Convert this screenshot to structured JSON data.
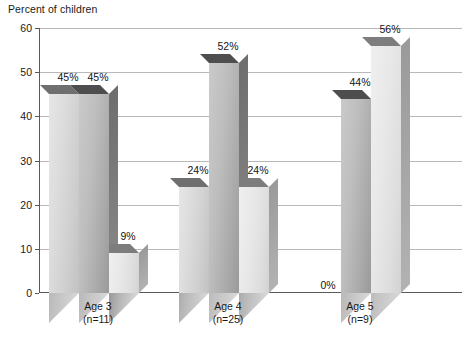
{
  "chart_data": {
    "type": "bar",
    "title": "",
    "subtitle": "",
    "ylabel": "Percent of children",
    "xlabel": "",
    "ylim": [
      0,
      60
    ],
    "yticks": [
      0,
      10,
      20,
      30,
      40,
      50,
      60
    ],
    "ytick_labels": [
      "0",
      "10",
      "20",
      "30",
      "40",
      "50",
      "60"
    ],
    "grid": true,
    "legend": "none",
    "categories": [
      "Age 3",
      "Age 4",
      "Age 5"
    ],
    "category_sublabels": [
      "(n=11)",
      "(n=25)",
      "(n=9)"
    ],
    "series": [
      {
        "name": "Series 1",
        "values": [
          45,
          24,
          0
        ],
        "data_labels": [
          "45%",
          "24%",
          "0%"
        ]
      },
      {
        "name": "Series 2",
        "values": [
          45,
          52,
          44
        ],
        "data_labels": [
          "45%",
          "52%",
          "44%"
        ]
      },
      {
        "name": "Series 3",
        "values": [
          9,
          24,
          56
        ],
        "data_labels": [
          "9%",
          "24%",
          "56%"
        ]
      }
    ],
    "colors": {
      "series1": "#dcdcdc",
      "series2": "#bdbdbd",
      "series3": "#e8e8e8",
      "gridline": "#b9b9b9",
      "axis": "#5a5a5a",
      "text": "#1a1a1a"
    }
  },
  "axis": {
    "y_title": "Percent of children"
  },
  "groups": [
    {
      "label": "Age 3",
      "sublabel": "(n=11)",
      "bars": [
        {
          "value": 45,
          "label": "45%",
          "tone": "tone-light"
        },
        {
          "value": 45,
          "label": "45%",
          "tone": "tone-mid"
        },
        {
          "value": 9,
          "label": "9%",
          "tone": "tone-pale"
        }
      ]
    },
    {
      "label": "Age 4",
      "sublabel": "(n=25)",
      "bars": [
        {
          "value": 24,
          "label": "24%",
          "tone": "tone-light"
        },
        {
          "value": 52,
          "label": "52%",
          "tone": "tone-mid"
        },
        {
          "value": 24,
          "label": "24%",
          "tone": "tone-pale"
        }
      ]
    },
    {
      "label": "Age 5",
      "sublabel": "(n=9)",
      "bars": [
        {
          "value": 0,
          "label": "0%",
          "tone": "tone-light"
        },
        {
          "value": 44,
          "label": "44%",
          "tone": "tone-mid"
        },
        {
          "value": 56,
          "label": "56%",
          "tone": "tone-pale"
        }
      ]
    }
  ]
}
